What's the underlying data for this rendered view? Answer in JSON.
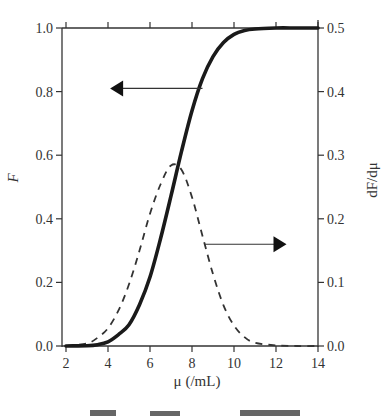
{
  "chart_data": {
    "type": "line",
    "title": "",
    "xlabel": "μ (/mL)",
    "ylabel": "F",
    "ylabel_right": "dF/dμ",
    "xlim": [
      2,
      14
    ],
    "ylim": [
      0.0,
      1.0
    ],
    "ylim_right": [
      0.0,
      0.5
    ],
    "x_ticks": [
      "2",
      "4",
      "6",
      "8",
      "10",
      "12",
      "14"
    ],
    "y_ticks": [
      "0.0",
      "0.2",
      "0.4",
      "0.6",
      "0.8",
      "1.0"
    ],
    "y_ticks_right": [
      "0.0",
      "0.1",
      "0.2",
      "0.3",
      "0.4",
      "0.5"
    ],
    "grid": false,
    "legend": "none (arrows indicate axis for each curve)",
    "annotations": [
      {
        "type": "arrow",
        "direction": "left",
        "from_x": 8.5,
        "to_x": 4.1,
        "y": 0.81,
        "meaning": "solid curve uses left axis F"
      },
      {
        "type": "arrow",
        "direction": "right",
        "from_x": 8.6,
        "to_x": 12.5,
        "y": 0.32,
        "meaning": "dashed curve uses right axis dF/dμ"
      }
    ],
    "x": [
      2,
      3,
      3.5,
      4,
      4.5,
      5,
      5.5,
      6,
      6.5,
      7,
      7.5,
      8,
      8.5,
      9,
      9.5,
      10,
      10.5,
      11,
      12,
      13,
      14
    ],
    "series": [
      {
        "name": "F",
        "axis": "left",
        "style": "solid-thick",
        "values": [
          0.0,
          0.001,
          0.004,
          0.013,
          0.036,
          0.067,
          0.13,
          0.217,
          0.337,
          0.472,
          0.612,
          0.74,
          0.841,
          0.91,
          0.954,
          0.98,
          0.992,
          0.997,
          1.0,
          1.0,
          1.0
        ]
      },
      {
        "name": "dF/dμ",
        "axis": "right",
        "style": "dashed",
        "values": [
          0.0,
          0.004,
          0.013,
          0.028,
          0.056,
          0.097,
          0.15,
          0.208,
          0.254,
          0.284,
          0.277,
          0.234,
          0.173,
          0.113,
          0.064,
          0.032,
          0.014,
          0.005,
          0.001,
          0.0,
          0.0
        ]
      }
    ]
  },
  "caption_partial": "图 … (cut off)"
}
